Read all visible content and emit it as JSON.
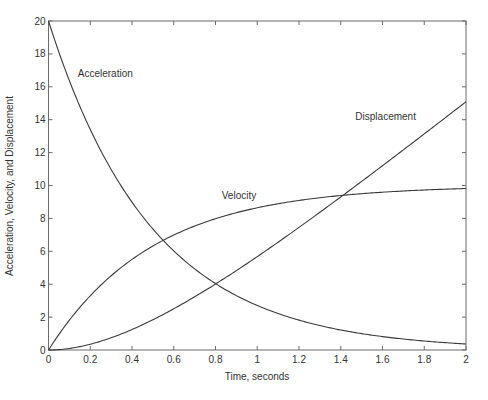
{
  "chart_data": {
    "type": "line",
    "title": "",
    "xlabel": "Time, seconds",
    "ylabel": "Acceleration, Velocity, and Displacement",
    "xlim": [
      0,
      2
    ],
    "ylim": [
      0,
      20
    ],
    "grid": false,
    "legend": "none (inline curve annotations)",
    "xticks": [
      "0",
      "0.2",
      "0.4",
      "0.6",
      "0.8",
      "1",
      "1.2",
      "1.4",
      "1.6",
      "1.8",
      "2"
    ],
    "yticks": [
      "0",
      "2",
      "4",
      "6",
      "8",
      "10",
      "12",
      "14",
      "16",
      "18",
      "20"
    ],
    "x": [
      0,
      0.1,
      0.2,
      0.3,
      0.4,
      0.5,
      0.6,
      0.7,
      0.8,
      0.9,
      1.0,
      1.1,
      1.2,
      1.3,
      1.4,
      1.5,
      1.6,
      1.7,
      1.8,
      1.9,
      2.0
    ],
    "series": [
      {
        "name": "Acceleration",
        "values": [
          20,
          16.37,
          13.41,
          10.98,
          8.99,
          7.36,
          6.02,
          4.93,
          4.04,
          3.31,
          2.71,
          2.22,
          1.81,
          1.49,
          1.22,
          1.0,
          0.82,
          0.67,
          0.55,
          0.45,
          0.37
        ]
      },
      {
        "name": "Velocity",
        "values": [
          0,
          1.81,
          3.3,
          4.51,
          5.51,
          6.32,
          6.99,
          7.53,
          7.98,
          8.35,
          8.65,
          8.89,
          9.09,
          9.26,
          9.39,
          9.5,
          9.59,
          9.67,
          9.73,
          9.78,
          9.82
        ]
      },
      {
        "name": "Displacement",
        "values": [
          0,
          0.09,
          0.35,
          0.74,
          1.25,
          1.84,
          2.51,
          3.23,
          4.01,
          4.83,
          5.68,
          6.56,
          7.45,
          8.37,
          9.3,
          10.25,
          11.2,
          12.17,
          13.14,
          14.11,
          15.09
        ]
      }
    ],
    "annotations": [
      {
        "text": "Acceleration",
        "x": 0.14,
        "y": 16.6
      },
      {
        "text": "Velocity",
        "x": 0.83,
        "y": 9.2
      },
      {
        "text": "Displacement",
        "x": 1.47,
        "y": 14.0
      }
    ]
  }
}
